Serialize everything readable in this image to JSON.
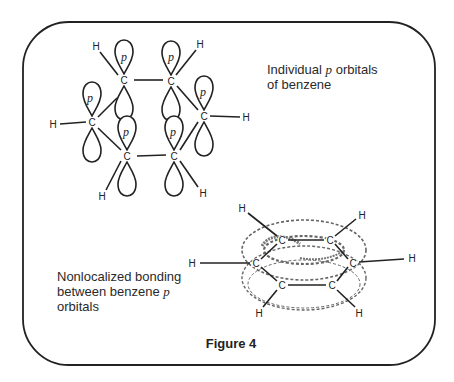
{
  "figure": {
    "caption": "Figure 4",
    "frame_color": "#222222"
  },
  "top_diagram": {
    "label_line1_pre": "Individual ",
    "label_line1_var": "p",
    "label_line1_post": " orbitals",
    "label_line2": "of benzene",
    "orbital_label": "p",
    "carbon_label": "C",
    "hydrogen_label": "H",
    "carbons": [
      {
        "id": "c1",
        "x": 124,
        "y": 80
      },
      {
        "id": "c2",
        "x": 171,
        "y": 81
      },
      {
        "id": "c3",
        "x": 92,
        "y": 122
      },
      {
        "id": "c4",
        "x": 204,
        "y": 116
      },
      {
        "id": "c5",
        "x": 127,
        "y": 156
      },
      {
        "id": "c6",
        "x": 174,
        "y": 156
      }
    ],
    "hydrogens": [
      {
        "id": "h1",
        "x": 96,
        "y": 46
      },
      {
        "id": "h2",
        "x": 200,
        "y": 44
      },
      {
        "id": "h3",
        "x": 53,
        "y": 124
      },
      {
        "id": "h4",
        "x": 246,
        "y": 117
      },
      {
        "id": "h5",
        "x": 102,
        "y": 196
      },
      {
        "id": "h6",
        "x": 203,
        "y": 193
      }
    ]
  },
  "bottom_diagram": {
    "label_line1": "Nonlocalized bonding",
    "label_line2_pre": "between benzene ",
    "label_line2_var": "p",
    "label_line3": "orbitals",
    "carbon_label": "C",
    "hydrogen_label": "H",
    "carbons": [
      {
        "id": "c1",
        "x": 282,
        "y": 240
      },
      {
        "id": "c2",
        "x": 330,
        "y": 240
      },
      {
        "id": "c3",
        "x": 256,
        "y": 263
      },
      {
        "id": "c4",
        "x": 353,
        "y": 263
      },
      {
        "id": "c5",
        "x": 282,
        "y": 285
      },
      {
        "id": "c6",
        "x": 332,
        "y": 285
      }
    ],
    "hydrogens": [
      {
        "id": "h1",
        "x": 242,
        "y": 208
      },
      {
        "id": "h2",
        "x": 362,
        "y": 215
      },
      {
        "id": "h3",
        "x": 192,
        "y": 263
      },
      {
        "id": "h4",
        "x": 412,
        "y": 258
      },
      {
        "id": "h5",
        "x": 259,
        "y": 313
      },
      {
        "id": "h6",
        "x": 359,
        "y": 313
      }
    ]
  }
}
